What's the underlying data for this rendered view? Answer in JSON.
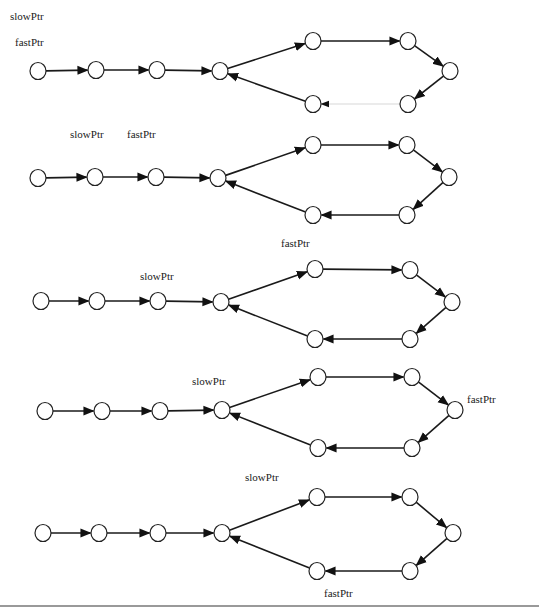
{
  "colors": {
    "node_stroke": "#222222",
    "edge": "#1a1a1a",
    "faint_edge": "#d8d8d8",
    "background": "#ffffff"
  },
  "diagrams": [
    {
      "nodes": [
        [
          38,
          71
        ],
        [
          96,
          70
        ],
        [
          157,
          70
        ],
        [
          220,
          71
        ],
        [
          313,
          41
        ],
        [
          408,
          41
        ],
        [
          450,
          71
        ],
        [
          313,
          104
        ],
        [
          408,
          104
        ]
      ],
      "edges": [
        [
          0,
          1
        ],
        [
          1,
          2
        ],
        [
          2,
          3
        ],
        [
          3,
          4
        ],
        [
          4,
          5
        ],
        [
          5,
          6
        ],
        [
          6,
          8
        ],
        [
          7,
          3
        ],
        [
          8,
          7,
          "faint"
        ]
      ],
      "labels": [
        {
          "text": "slowPtr",
          "x": 10,
          "y": 20
        },
        {
          "text": "fastPtr",
          "x": 15,
          "y": 46
        }
      ]
    },
    {
      "nodes": [
        [
          38,
          178
        ],
        [
          95,
          177
        ],
        [
          156,
          177
        ],
        [
          218,
          178
        ],
        [
          313,
          145
        ],
        [
          407,
          145
        ],
        [
          449,
          177
        ],
        [
          313,
          215
        ],
        [
          407,
          215
        ]
      ],
      "edges": [
        [
          0,
          1
        ],
        [
          1,
          2
        ],
        [
          2,
          3
        ],
        [
          3,
          4
        ],
        [
          4,
          5
        ],
        [
          5,
          6
        ],
        [
          6,
          8
        ],
        [
          8,
          7
        ],
        [
          7,
          3
        ]
      ],
      "labels": [
        {
          "text": "slowPtr",
          "x": 70,
          "y": 138
        },
        {
          "text": "fastPtr",
          "x": 127,
          "y": 138
        }
      ]
    },
    {
      "nodes": [
        [
          41,
          301
        ],
        [
          97,
          301
        ],
        [
          158,
          301
        ],
        [
          221,
          302
        ],
        [
          315,
          269
        ],
        [
          410,
          270
        ],
        [
          452,
          302
        ],
        [
          315,
          339
        ],
        [
          410,
          339
        ]
      ],
      "edges": [
        [
          0,
          1
        ],
        [
          1,
          2
        ],
        [
          2,
          3
        ],
        [
          3,
          4
        ],
        [
          4,
          5
        ],
        [
          5,
          6
        ],
        [
          6,
          8
        ],
        [
          8,
          7
        ],
        [
          7,
          3
        ]
      ],
      "labels": [
        {
          "text": "slowPtr",
          "x": 140,
          "y": 280
        },
        {
          "text": "fastPtr",
          "x": 281,
          "y": 247
        }
      ]
    },
    {
      "nodes": [
        [
          45,
          411
        ],
        [
          102,
          411
        ],
        [
          160,
          411
        ],
        [
          222,
          410
        ],
        [
          318,
          377
        ],
        [
          412,
          377
        ],
        [
          455,
          410
        ],
        [
          318,
          448
        ],
        [
          412,
          448
        ]
      ],
      "edges": [
        [
          0,
          1
        ],
        [
          1,
          2
        ],
        [
          2,
          3
        ],
        [
          3,
          4
        ],
        [
          4,
          5
        ],
        [
          5,
          6
        ],
        [
          6,
          8
        ],
        [
          8,
          7
        ],
        [
          7,
          3
        ]
      ],
      "labels": [
        {
          "text": "slowPtr",
          "x": 192,
          "y": 385
        },
        {
          "text": "fastPtr",
          "x": 467,
          "y": 403
        }
      ]
    },
    {
      "nodes": [
        [
          43,
          533
        ],
        [
          99,
          533
        ],
        [
          158,
          533
        ],
        [
          222,
          533
        ],
        [
          317,
          497
        ],
        [
          410,
          497
        ],
        [
          453,
          533
        ],
        [
          317,
          571
        ],
        [
          410,
          571
        ]
      ],
      "edges": [
        [
          0,
          1
        ],
        [
          1,
          2
        ],
        [
          2,
          3
        ],
        [
          3,
          4
        ],
        [
          4,
          5
        ],
        [
          5,
          6
        ],
        [
          6,
          8
        ],
        [
          8,
          7
        ],
        [
          7,
          3
        ]
      ],
      "labels": [
        {
          "text": "slowPtr",
          "x": 245,
          "y": 481
        },
        {
          "text": "fastPtr",
          "x": 324,
          "y": 597
        }
      ]
    }
  ]
}
